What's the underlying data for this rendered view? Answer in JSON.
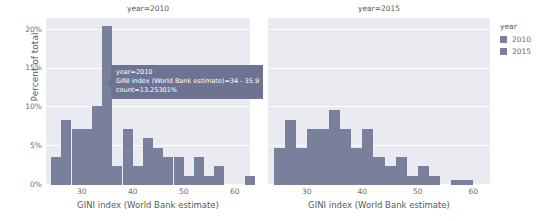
{
  "legend": {
    "title": "year",
    "items": [
      {
        "label": "2010",
        "color": "#7a7f9c"
      },
      {
        "label": "2015",
        "color": "#7a7f9c"
      }
    ]
  },
  "tooltip": {
    "line1": "year=2010",
    "line2": "GINI index (World Bank estimate)=34 - 35.9",
    "line3": "count=13.25301%"
  },
  "axes": {
    "ylabel": "Percent of total",
    "yticks": [
      "0%",
      "5%",
      "10%",
      "15%",
      "20%"
    ],
    "xlabel": "GINI index (World Bank estimate)",
    "xticks": [
      "30",
      "40",
      "50",
      "60"
    ]
  },
  "chart_data": {
    "type": "bar",
    "title": "",
    "subtitle": "Faceted histogram of GINI index by year",
    "xlabel": "GINI index (World Bank estimate)",
    "ylabel": "Percent of total",
    "ylim": [
      0,
      21.5
    ],
    "xlim": [
      23,
      63
    ],
    "grid": true,
    "legend_position": "right",
    "facets": [
      {
        "label": "year=2010",
        "bin_width": 2,
        "bins": [
          {
            "x0": 24,
            "x1": 26,
            "value": 3.6
          },
          {
            "x0": 26,
            "x1": 28,
            "value": 8.4
          },
          {
            "x0": 28,
            "x1": 30,
            "value": 7.2
          },
          {
            "x0": 30,
            "x1": 32,
            "value": 7.2
          },
          {
            "x0": 32,
            "x1": 34,
            "value": 10.2
          },
          {
            "x0": 34,
            "x1": 36,
            "value": 20.5
          },
          {
            "x0": 36,
            "x1": 38,
            "value": 2.4
          },
          {
            "x0": 38,
            "x1": 40,
            "value": 7.2
          },
          {
            "x0": 40,
            "x1": 42,
            "value": 2.4
          },
          {
            "x0": 42,
            "x1": 44,
            "value": 6.0
          },
          {
            "x0": 44,
            "x1": 46,
            "value": 4.8
          },
          {
            "x0": 46,
            "x1": 48,
            "value": 3.6
          },
          {
            "x0": 48,
            "x1": 50,
            "value": 3.6
          },
          {
            "x0": 50,
            "x1": 52,
            "value": 1.2
          },
          {
            "x0": 52,
            "x1": 54,
            "value": 3.6
          },
          {
            "x0": 54,
            "x1": 56,
            "value": 1.2
          },
          {
            "x0": 56,
            "x1": 58,
            "value": 2.4
          },
          {
            "x0": 62,
            "x1": 64,
            "value": 1.2
          }
        ]
      },
      {
        "label": "year=2015",
        "bin_width": 2,
        "bins": [
          {
            "x0": 24,
            "x1": 26,
            "value": 4.8
          },
          {
            "x0": 26,
            "x1": 28,
            "value": 8.4
          },
          {
            "x0": 28,
            "x1": 30,
            "value": 4.8
          },
          {
            "x0": 30,
            "x1": 32,
            "value": 7.2
          },
          {
            "x0": 32,
            "x1": 34,
            "value": 7.2
          },
          {
            "x0": 34,
            "x1": 36,
            "value": 9.6
          },
          {
            "x0": 36,
            "x1": 38,
            "value": 7.2
          },
          {
            "x0": 38,
            "x1": 40,
            "value": 4.8
          },
          {
            "x0": 40,
            "x1": 42,
            "value": 7.2
          },
          {
            "x0": 42,
            "x1": 44,
            "value": 3.6
          },
          {
            "x0": 44,
            "x1": 46,
            "value": 2.4
          },
          {
            "x0": 46,
            "x1": 48,
            "value": 3.6
          },
          {
            "x0": 48,
            "x1": 50,
            "value": 1.2
          },
          {
            "x0": 50,
            "x1": 52,
            "value": 2.4
          },
          {
            "x0": 52,
            "x1": 54,
            "value": 1.2
          },
          {
            "x0": 56,
            "x1": 58,
            "value": 0.7
          },
          {
            "x0": 58,
            "x1": 60,
            "value": 0.7
          }
        ]
      }
    ]
  }
}
